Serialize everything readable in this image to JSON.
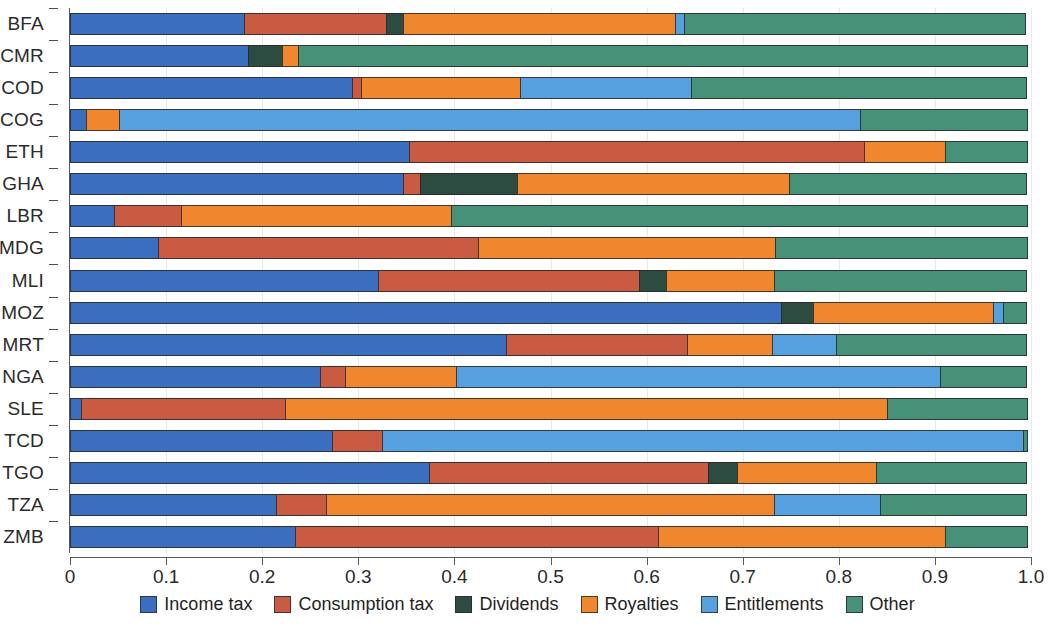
{
  "chart_data": {
    "type": "bar",
    "orientation": "horizontal",
    "stacked": true,
    "normalized": true,
    "title": "",
    "xlabel": "",
    "ylabel": "",
    "xlim": [
      0,
      1
    ],
    "xticks": [
      "0",
      "0.1",
      "0.2",
      "0.3",
      "0.4",
      "0.5",
      "0.6",
      "0.7",
      "0.8",
      "0.9",
      "1.0"
    ],
    "xtick_values": [
      0,
      0.1,
      0.2,
      0.3,
      0.4,
      0.5,
      0.6,
      0.7,
      0.8,
      0.9,
      1.0
    ],
    "grid": true,
    "legend_position": "bottom",
    "categories": [
      "BFA",
      "CMR",
      "COD",
      "COG",
      "ETH",
      "GHA",
      "LBR",
      "MDG",
      "MLI",
      "MOZ",
      "MRT",
      "NGA",
      "SLE",
      "TCD",
      "TGO",
      "TZA",
      "ZMB"
    ],
    "series": [
      {
        "name": "Income tax",
        "color": "#3a6fbf",
        "values": [
          0.182,
          0.186,
          0.294,
          0.018,
          0.354,
          0.348,
          0.047,
          0.093,
          0.322,
          0.741,
          0.455,
          0.261,
          0.012,
          0.274,
          0.375,
          0.215,
          0.235
        ]
      },
      {
        "name": "Consumption tax",
        "color": "#c95b43",
        "values": [
          0.149,
          0.0,
          0.011,
          0.0,
          0.474,
          0.018,
          0.071,
          0.334,
          0.272,
          0.0,
          0.189,
          0.027,
          0.214,
          0.053,
          0.291,
          0.053,
          0.379
        ]
      },
      {
        "name": "Dividends",
        "color": "#2c4c42",
        "values": [
          0.019,
          0.037,
          0.0,
          0.0,
          0.0,
          0.102,
          0.0,
          0.0,
          0.029,
          0.034,
          0.0,
          0.0,
          0.0,
          0.0,
          0.031,
          0.0,
          0.0
        ]
      },
      {
        "name": "Royalties",
        "color": "#f0872f",
        "values": [
          0.284,
          0.017,
          0.166,
          0.035,
          0.086,
          0.284,
          0.282,
          0.31,
          0.114,
          0.189,
          0.09,
          0.117,
          0.627,
          0.0,
          0.146,
          0.468,
          0.3
        ]
      },
      {
        "name": "Entitlements",
        "color": "#57a0e0",
        "values": [
          0.01,
          0.0,
          0.179,
          0.772,
          0.0,
          0.0,
          0.0,
          0.0,
          0.0,
          0.011,
          0.067,
          0.504,
          0.0,
          0.668,
          0.0,
          0.111,
          0.0
        ]
      },
      {
        "name": "Other",
        "color": "#469178",
        "values": [
          0.356,
          0.76,
          0.35,
          0.175,
          0.086,
          0.248,
          0.6,
          0.263,
          0.263,
          0.025,
          0.199,
          0.091,
          0.147,
          0.005,
          0.157,
          0.153,
          0.086
        ]
      }
    ]
  },
  "legend": {
    "items": [
      {
        "label": "Income tax",
        "color": "#3a6fbf"
      },
      {
        "label": "Consumption tax",
        "color": "#c95b43"
      },
      {
        "label": "Dividends",
        "color": "#2c4c42"
      },
      {
        "label": "Royalties",
        "color": "#f0872f"
      },
      {
        "label": "Entitlements",
        "color": "#57a0e0"
      },
      {
        "label": "Other",
        "color": "#469178"
      }
    ]
  }
}
